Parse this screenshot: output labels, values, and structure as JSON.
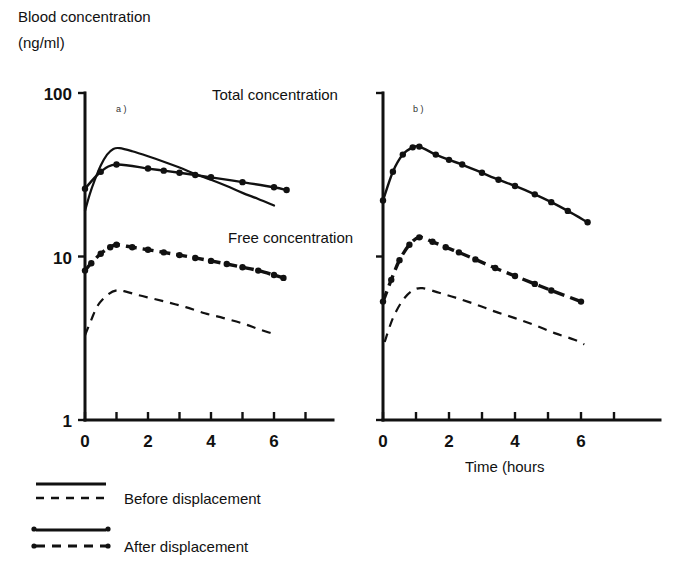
{
  "chart_data": {
    "type": "line",
    "title": "Blood concentration (ng/ml)",
    "ylabel_line1": "Blood concentration",
    "ylabel_line2": "(ng/ml)",
    "xlabel": "Time (hours",
    "yscale": "log",
    "ylim": [
      1,
      100
    ],
    "ytick_labels": [
      "100",
      "10",
      "1"
    ],
    "ytick_values": [
      100,
      10,
      1
    ],
    "xlim": [
      0,
      7
    ],
    "xtick_labels": [
      "0",
      "2",
      "4",
      "6"
    ],
    "xtick_values": [
      0,
      2,
      4,
      6
    ],
    "xticks_minor": [
      0,
      1,
      2,
      3,
      4,
      5,
      6,
      7
    ],
    "grid": false,
    "legend_position": "bottom-left",
    "annotations": [
      {
        "text": "Total concentration",
        "x_px": 212,
        "y_px": 100
      },
      {
        "text": "Free concentration",
        "x_px": 228,
        "y_px": 243
      }
    ],
    "panels": [
      {
        "id": "a",
        "label": "a )",
        "series": [
          {
            "name": "Total concentration - Before displacement",
            "style": "solid",
            "markers": false,
            "x": [
              0,
              0.15,
              0.3,
              0.5,
              0.7,
              0.9,
              1.1,
              1.5,
              2.0,
              2.5,
              3.0,
              3.5,
              4.0,
              4.5,
              5.0,
              5.5,
              6.0
            ],
            "values": [
              19.0,
              24.0,
              29.0,
              36.0,
              42.0,
              45.5,
              46.0,
              44.0,
              41.0,
              38.0,
              35.0,
              32.0,
              29.5,
              27.0,
              24.5,
              22.5,
              20.5
            ]
          },
          {
            "name": "Total concentration - After displacement",
            "style": "solid",
            "markers": true,
            "x": [
              0,
              0.5,
              1.0,
              2.0,
              2.5,
              3.0,
              3.5,
              4.0,
              5.0,
              6.0,
              6.4
            ],
            "values": [
              26.0,
              33.0,
              36.5,
              34.5,
              33.5,
              32.5,
              31.5,
              30.5,
              28.5,
              26.5,
              25.5
            ]
          },
          {
            "name": "Free concentration - After displacement",
            "style": "dashed",
            "markers": true,
            "x": [
              0,
              0.2,
              0.5,
              0.8,
              1.0,
              1.5,
              2.0,
              2.5,
              3.0,
              3.5,
              4.0,
              4.5,
              5.0,
              5.5,
              6.0,
              6.3
            ],
            "values": [
              8.2,
              9.1,
              10.4,
              11.4,
              11.8,
              11.4,
              11.0,
              10.6,
              10.2,
              9.8,
              9.4,
              9.0,
              8.6,
              8.2,
              7.7,
              7.4
            ]
          },
          {
            "name": "Free concentration - Before displacement",
            "style": "dashed",
            "markers": false,
            "x": [
              0,
              0.2,
              0.4,
              0.7,
              1.0,
              1.3,
              1.7,
              2.2,
              2.7,
              3.2,
              3.8,
              4.4,
              5.0,
              5.5,
              5.9
            ],
            "values": [
              3.3,
              4.1,
              5.0,
              5.8,
              6.2,
              6.1,
              5.8,
              5.5,
              5.2,
              4.9,
              4.5,
              4.2,
              3.9,
              3.6,
              3.4
            ]
          }
        ]
      },
      {
        "id": "b",
        "label": "b )",
        "series": [
          {
            "name": "Total concentration - After displacement",
            "style": "solid",
            "markers": true,
            "x": [
              0,
              0.3,
              0.6,
              0.9,
              1.1,
              1.6,
              2.0,
              2.4,
              3.0,
              3.5,
              4.0,
              4.6,
              5.1,
              5.6,
              6.2
            ],
            "values": [
              22.0,
              33.0,
              42.0,
              46.5,
              47.0,
              42.0,
              39.0,
              36.5,
              32.5,
              29.5,
              27.0,
              24.0,
              21.5,
              19.0,
              16.2
            ]
          },
          {
            "name": "Free concentration - After displacement",
            "style": "dashed",
            "markers": true,
            "x": [
              0,
              0.25,
              0.5,
              0.8,
              1.1,
              1.5,
              1.9,
              2.3,
              2.8,
              3.4,
              4.0,
              4.6,
              5.1,
              6.0
            ],
            "values": [
              5.3,
              7.2,
              9.5,
              11.8,
              13.1,
              12.3,
              11.4,
              10.6,
              9.6,
              8.5,
              7.6,
              6.8,
              6.2,
              5.3
            ]
          },
          {
            "name": "Free concentration - Before displacement",
            "style": "dashed",
            "markers": false,
            "x": [
              0.05,
              0.3,
              0.6,
              0.9,
              1.2,
              1.7,
              2.2,
              2.8,
              3.4,
              4.0,
              4.6,
              5.2,
              5.8,
              6.1
            ],
            "values": [
              3.0,
              4.2,
              5.4,
              6.2,
              6.4,
              6.0,
              5.6,
              5.1,
              4.6,
              4.2,
              3.8,
              3.4,
              3.1,
              2.9
            ]
          }
        ]
      }
    ],
    "legend": [
      {
        "key": "before-displacement",
        "label": "Before displacement",
        "solid_markers": false,
        "dashed_markers": false
      },
      {
        "key": "after-displacement",
        "label": "After displacement",
        "solid_markers": true,
        "dashed_markers": true
      }
    ]
  }
}
